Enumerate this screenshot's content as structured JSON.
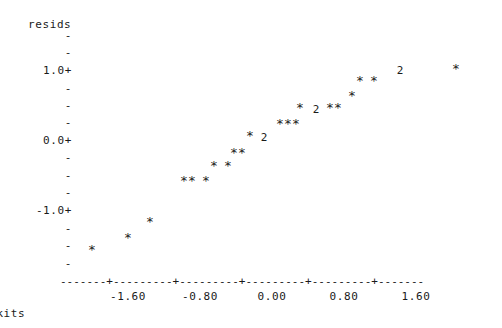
{
  "plot": {
    "y_axis_title": "resids",
    "x_axis_title": "Rankits",
    "axis_line": "-------+---------+---------+---------+---------+-------",
    "y_ticks": [
      {
        "label": "-",
        "y": 35,
        "type": "minor"
      },
      {
        "label": "-",
        "y": 52,
        "type": "minor"
      },
      {
        "label": "1.0+",
        "y": 70,
        "type": "major"
      },
      {
        "label": "-",
        "y": 88,
        "type": "minor"
      },
      {
        "label": "-",
        "y": 105,
        "type": "minor"
      },
      {
        "label": "-",
        "y": 122,
        "type": "minor"
      },
      {
        "label": "0.0+",
        "y": 140,
        "type": "major"
      },
      {
        "label": "-",
        "y": 157,
        "type": "minor"
      },
      {
        "label": "-",
        "y": 175,
        "type": "minor"
      },
      {
        "label": "-",
        "y": 192,
        "type": "minor"
      },
      {
        "label": "-1.0+",
        "y": 210,
        "type": "major"
      },
      {
        "label": "-",
        "y": 228,
        "type": "minor"
      },
      {
        "label": "-",
        "y": 245,
        "type": "minor"
      },
      {
        "label": "-",
        "y": 263,
        "type": "minor"
      }
    ],
    "x_ticks": [
      {
        "label": "-1.60",
        "x": 128
      },
      {
        "label": "-0.80",
        "x": 200
      },
      {
        "label": "0.00",
        "x": 272
      },
      {
        "label": "0.80",
        "x": 344
      },
      {
        "label": "1.60",
        "x": 416
      }
    ]
  },
  "chart_data": {
    "type": "scatter",
    "title": "",
    "subtitle": "",
    "xlabel": "Rankits",
    "ylabel": "resids",
    "xlim": [
      -2.1,
      2.1
    ],
    "ylim": [
      -1.55,
      1.35
    ],
    "grid": false,
    "legend": false,
    "marker": "*",
    "overplot_label": "2",
    "note": "Character-mode normal probability plot; marker '2' denotes two coincident observations.",
    "points": [
      {
        "x": -1.74,
        "y": -1.28,
        "label": "*",
        "count": 1,
        "px": 92,
        "py": 250
      },
      {
        "x": -1.38,
        "y": -1.17,
        "label": "*",
        "count": 1,
        "px": 128,
        "py": 238
      },
      {
        "x": -1.15,
        "y": -1.06,
        "label": "*",
        "count": 1,
        "px": 150,
        "py": 222
      },
      {
        "x": -0.93,
        "y": -0.88,
        "label": "*",
        "count": 1,
        "px": 184,
        "py": 181
      },
      {
        "x": -0.85,
        "y": -0.88,
        "label": "*",
        "count": 1,
        "px": 192,
        "py": 181
      },
      {
        "x": -0.73,
        "y": -0.88,
        "label": "*",
        "count": 1,
        "px": 206,
        "py": 181
      },
      {
        "x": -0.6,
        "y": -0.76,
        "label": "*",
        "count": 1,
        "px": 214,
        "py": 166
      },
      {
        "x": -0.45,
        "y": -0.76,
        "label": "*",
        "count": 1,
        "px": 228,
        "py": 166
      },
      {
        "x": -0.33,
        "y": -0.62,
        "label": "*",
        "count": 1,
        "px": 234,
        "py": 153
      },
      {
        "x": -0.26,
        "y": -0.62,
        "label": "*",
        "count": 1,
        "px": 242,
        "py": 153
      },
      {
        "x": -0.15,
        "y": -0.42,
        "label": "*",
        "count": 1,
        "px": 250,
        "py": 136
      },
      {
        "x": -0.02,
        "y": -0.42,
        "label": "2",
        "count": 2,
        "px": 264,
        "py": 138
      },
      {
        "x": 0.15,
        "y": -0.16,
        "label": "*",
        "count": 1,
        "px": 280,
        "py": 124
      },
      {
        "x": 0.22,
        "y": -0.16,
        "label": "*",
        "count": 1,
        "px": 288,
        "py": 124
      },
      {
        "x": 0.3,
        "y": -0.16,
        "label": "*",
        "count": 1,
        "px": 296,
        "py": 124
      },
      {
        "x": 0.42,
        "y": 0.12,
        "label": "*",
        "count": 1,
        "px": 300,
        "py": 108
      },
      {
        "x": 0.55,
        "y": 0.12,
        "label": "2",
        "count": 2,
        "px": 316,
        "py": 110
      },
      {
        "x": 0.68,
        "y": 0.12,
        "label": "*",
        "count": 1,
        "px": 330,
        "py": 108
      },
      {
        "x": 0.75,
        "y": 0.12,
        "label": "*",
        "count": 1,
        "px": 338,
        "py": 108
      },
      {
        "x": 0.92,
        "y": 0.45,
        "label": "*",
        "count": 1,
        "px": 352,
        "py": 96
      },
      {
        "x": 1.08,
        "y": 0.72,
        "label": "*",
        "count": 1,
        "px": 360,
        "py": 81
      },
      {
        "x": 1.2,
        "y": 0.72,
        "label": "*",
        "count": 1,
        "px": 374,
        "py": 81
      },
      {
        "x": 1.42,
        "y": 0.95,
        "label": "2",
        "count": 2,
        "px": 400,
        "py": 71
      },
      {
        "x": 1.92,
        "y": 0.95,
        "label": "*",
        "count": 1,
        "px": 456,
        "py": 69
      }
    ]
  }
}
